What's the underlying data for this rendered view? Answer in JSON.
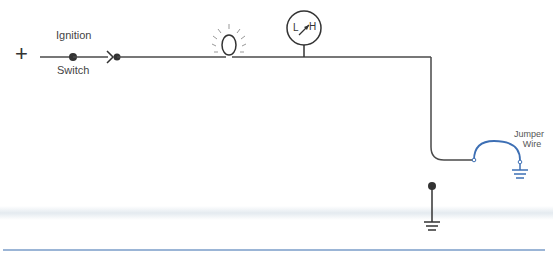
{
  "diagram": {
    "type": "electrical-circuit",
    "labels": {
      "plus": "+",
      "switch_top": "Ignition",
      "switch_bottom": "Switch",
      "jumper_top": "Jumper",
      "jumper_bottom": "Wire",
      "gauge_low": "L",
      "gauge_high": "H"
    },
    "components": [
      {
        "id": "battery-positive",
        "symbol": "+"
      },
      {
        "id": "ignition-switch",
        "label": "Ignition Switch"
      },
      {
        "id": "connector",
        "symbol": "connector-chevron"
      },
      {
        "id": "indicator-lamp",
        "symbol": "lamp-with-rays"
      },
      {
        "id": "gauge",
        "symbol": "meter L-H"
      },
      {
        "id": "sender-ground",
        "symbol": "ground"
      },
      {
        "id": "jumper-wire",
        "label": "Jumper Wire"
      },
      {
        "id": "jumper-ground",
        "symbol": "ground"
      }
    ],
    "colors": {
      "wire": "#4a4a4a",
      "jumper": "#3d6fb4",
      "rule": "#7a9cc8"
    }
  }
}
